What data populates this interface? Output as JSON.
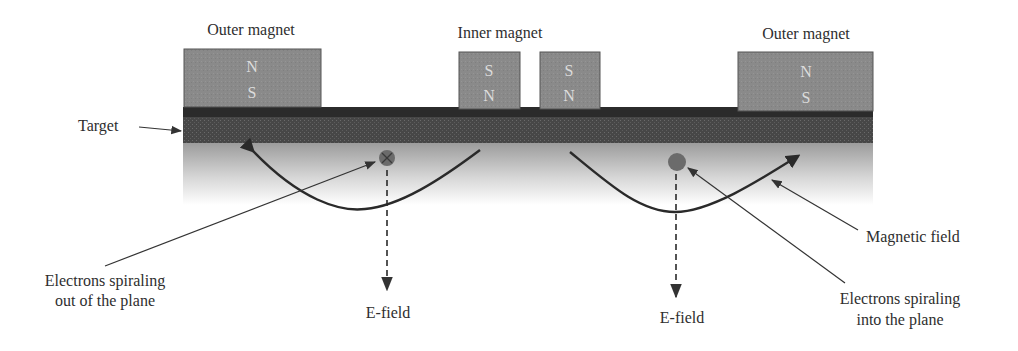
{
  "figure": {
    "colors": {
      "magnet_fill": "#8a8a8a",
      "magnet_border": "#555555",
      "target_top": "#2a2a2a",
      "target_body": "#4a4a4a",
      "plasma_top": "#9a9a9a",
      "plasma_bottom": "#ffffff",
      "field_line": "#2a2a2a",
      "electron_fill": "#6e6e6e",
      "label_text": "#2e2e2e"
    },
    "labels": {
      "outer_magnet_left": "Outer magnet",
      "inner_magnet": "Inner magnet",
      "outer_magnet_right": "Outer magnet",
      "target": "Target",
      "magnetic_field": "Magnetic field",
      "electrons_out_line1": "Electrons spiraling",
      "electrons_out_line2": "out of the plane",
      "electrons_in_line1": "Electrons spiraling",
      "electrons_in_line2": "into the plane",
      "e_field_left": "E-field",
      "e_field_right": "E-field"
    },
    "magnets": [
      {
        "name": "outer-magnet-left",
        "top_pole": "N",
        "bottom_pole": "S"
      },
      {
        "name": "inner-magnet-left",
        "top_pole": "S",
        "bottom_pole": "N"
      },
      {
        "name": "inner-magnet-right",
        "top_pole": "S",
        "bottom_pole": "N"
      },
      {
        "name": "outer-magnet-right",
        "top_pole": "N",
        "bottom_pole": "S"
      }
    ],
    "electrons": [
      {
        "name": "electron-out-of-plane",
        "symbol": "⊗"
      },
      {
        "name": "electron-into-plane",
        "symbol": "●"
      }
    ]
  }
}
